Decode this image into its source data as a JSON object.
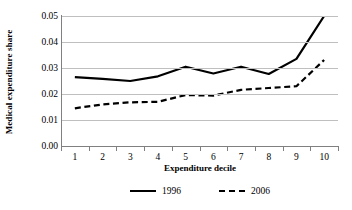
{
  "chart_data": {
    "type": "line",
    "title": "",
    "xlabel": "Expenditure decile",
    "ylabel": "Medical expenditure share",
    "categories": [
      "1",
      "2",
      "3",
      "4",
      "5",
      "6",
      "7",
      "8",
      "9",
      "10"
    ],
    "x": [
      1,
      2,
      3,
      4,
      5,
      6,
      7,
      8,
      9,
      10
    ],
    "series": [
      {
        "name": "1996",
        "style": "solid",
        "color": "#000000",
        "values": [
          0.0265,
          0.0258,
          0.025,
          0.0268,
          0.0305,
          0.0279,
          0.0305,
          0.0277,
          0.0335,
          0.05
        ]
      },
      {
        "name": "2006",
        "style": "dashed",
        "color": "#000000",
        "values": [
          0.0145,
          0.016,
          0.0168,
          0.017,
          0.0196,
          0.0194,
          0.0216,
          0.0223,
          0.023,
          0.0331
        ]
      }
    ],
    "yticks": [
      "0.00",
      "0.01",
      "0.02",
      "0.03",
      "0.04",
      "0.05"
    ],
    "ytick_values": [
      0.0,
      0.01,
      0.02,
      0.03,
      0.04,
      0.05
    ],
    "ylim": [
      0.0,
      0.05
    ],
    "xlim": [
      0.5,
      10.5
    ],
    "grid": "horizontal",
    "legend_position": "bottom",
    "gridline_color": "#bfbfbf",
    "axis_color": "#808080"
  },
  "legend": {
    "items": [
      {
        "label": "1996",
        "style": "solid"
      },
      {
        "label": "2006",
        "style": "dashed"
      }
    ]
  }
}
